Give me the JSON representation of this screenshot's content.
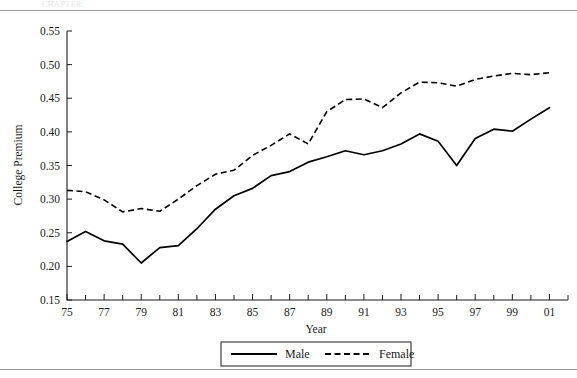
{
  "figure": {
    "header_fragment": "CHAPTER",
    "background_color": "#ffffff",
    "line_color": "#000000",
    "rule_color": "#9a9a9a"
  },
  "legend": {
    "male_label": "Male",
    "female_label": "Female"
  },
  "chart_data": {
    "type": "line",
    "title": "",
    "xlabel": "Year",
    "ylabel": "College Premium",
    "xlim": [
      1975,
      2002
    ],
    "ylim": [
      0.15,
      0.55
    ],
    "grid": false,
    "legend_position": "below-axis",
    "x_tick_labels": [
      "75",
      "77",
      "79",
      "81",
      "83",
      "85",
      "87",
      "89",
      "91",
      "93",
      "95",
      "97",
      "99",
      "01"
    ],
    "x_tick_values": [
      1975,
      1977,
      1979,
      1981,
      1983,
      1985,
      1987,
      1989,
      1991,
      1993,
      1995,
      1997,
      1999,
      2001
    ],
    "x_minor_tick_values": [
      1976,
      1978,
      1980,
      1982,
      1984,
      1986,
      1988,
      1990,
      1992,
      1994,
      1996,
      1998,
      2000,
      2002
    ],
    "y_tick_labels": [
      "0.15",
      "0.20",
      "0.25",
      "0.30",
      "0.35",
      "0.40",
      "0.45",
      "0.50",
      "0.55"
    ],
    "y_tick_values": [
      0.15,
      0.2,
      0.25,
      0.3,
      0.35,
      0.4,
      0.45,
      0.5,
      0.55
    ],
    "x": [
      1975,
      1976,
      1977,
      1978,
      1979,
      1980,
      1981,
      1982,
      1983,
      1984,
      1985,
      1986,
      1987,
      1988,
      1989,
      1990,
      1991,
      1992,
      1993,
      1994,
      1995,
      1996,
      1997,
      1998,
      1999,
      2000,
      2001
    ],
    "series": [
      {
        "name": "Male",
        "style": "solid",
        "values": [
          0.237,
          0.252,
          0.238,
          0.233,
          0.205,
          0.228,
          0.231,
          0.256,
          0.285,
          0.305,
          0.316,
          0.335,
          0.341,
          0.355,
          0.363,
          0.372,
          0.366,
          0.372,
          0.382,
          0.397,
          0.386,
          0.35,
          0.39,
          0.404,
          0.401,
          0.419,
          0.436
        ]
      },
      {
        "name": "Female",
        "style": "dashed",
        "values": [
          0.313,
          0.311,
          0.299,
          0.281,
          0.286,
          0.282,
          0.3,
          0.32,
          0.337,
          0.343,
          0.365,
          0.38,
          0.397,
          0.382,
          0.43,
          0.448,
          0.449,
          0.436,
          0.458,
          0.474,
          0.473,
          0.468,
          0.478,
          0.483,
          0.487,
          0.485,
          0.488
        ]
      }
    ]
  }
}
